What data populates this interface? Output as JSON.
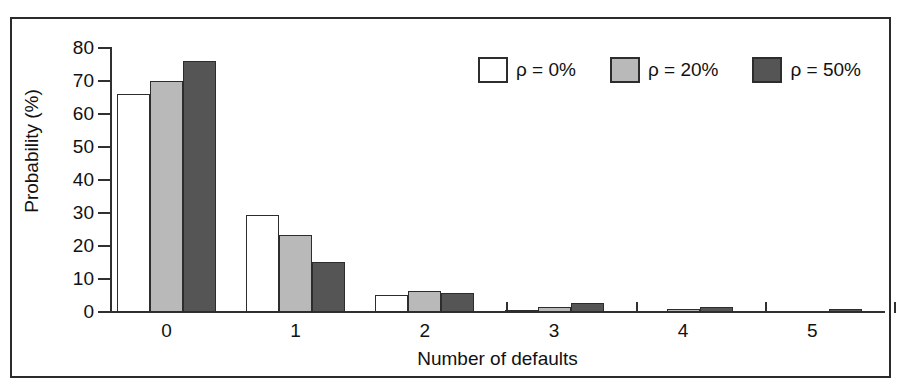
{
  "chart_data": {
    "type": "bar",
    "title": "",
    "xlabel": "Number of defaults",
    "ylabel": "Probability (%)",
    "categories": [
      "0",
      "1",
      "2",
      "3",
      "4",
      "5"
    ],
    "ylim": [
      0,
      80
    ],
    "yticks": [
      "0",
      "10",
      "20",
      "30",
      "40",
      "50",
      "60",
      "70",
      "80"
    ],
    "grid": false,
    "legend_position": "top-right",
    "series": [
      {
        "name": "ρ = 0%",
        "color": "#ffffff",
        "values": [
          66.0,
          29.5,
          5.3,
          0.6,
          0.0,
          0.0
        ]
      },
      {
        "name": "ρ = 20%",
        "color": "#b9b9b9",
        "values": [
          70.0,
          23.4,
          6.4,
          1.6,
          0.8,
          0.0
        ]
      },
      {
        "name": "ρ = 50%",
        "color": "#555555",
        "values": [
          76.0,
          15.2,
          5.8,
          2.6,
          1.6,
          0.8
        ]
      }
    ]
  },
  "axes": {
    "y_title": "Probability (%)",
    "x_title": "Number of defaults",
    "y_ticks": [
      "80",
      "70",
      "60",
      "50",
      "40",
      "30",
      "20",
      "10",
      "0"
    ],
    "x_ticks": [
      "0",
      "1",
      "2",
      "3",
      "4",
      "5"
    ]
  },
  "legend": {
    "items": [
      {
        "label": "ρ = 0%",
        "swatch": "white-swatch"
      },
      {
        "label": "ρ = 20%",
        "swatch": "light-gray-swatch"
      },
      {
        "label": "ρ = 50%",
        "swatch": "dark-gray-swatch"
      }
    ]
  },
  "colors": {
    "series_0": "#ffffff",
    "series_1": "#b9b9b9",
    "series_2": "#555555",
    "axis": "#303030",
    "frame": "#2b2b2b",
    "text": "#111111"
  }
}
